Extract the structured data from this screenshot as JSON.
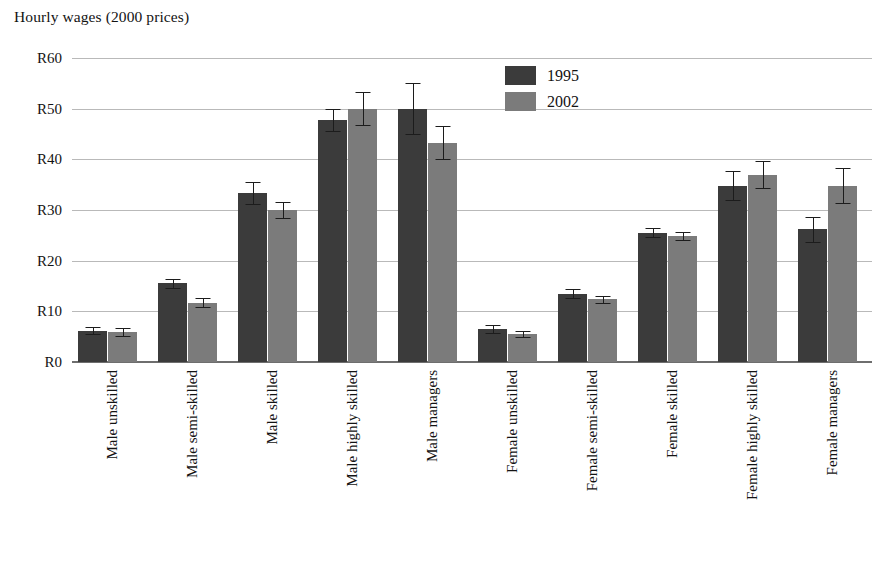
{
  "chart_data": {
    "type": "bar",
    "title": "Hourly wages (2000 prices)",
    "xlabel": "",
    "ylabel": "",
    "ylim": [
      0,
      60
    ],
    "ytick_labels": [
      "R60",
      "R50",
      "R40",
      "R30",
      "R20",
      "R10",
      "R0"
    ],
    "ytick_values": [
      60,
      50,
      40,
      30,
      20,
      10,
      0
    ],
    "grid": true,
    "legend_position": "top-center-right",
    "currency_prefix": "R",
    "categories": [
      "Male unskilled",
      "Male semi-skilled",
      "Male skilled",
      "Male highly skilled",
      "Male managers",
      "Female unskilled",
      "Female semi-skilled",
      "Female skilled",
      "Female highly skilled",
      "Female managers"
    ],
    "series": [
      {
        "name": "1995",
        "color": "#3b3b3b",
        "values": [
          6.2,
          15.5,
          33.4,
          47.7,
          50.0,
          6.5,
          13.5,
          25.5,
          34.8,
          26.2
        ],
        "errors": [
          0.7,
          0.8,
          2.2,
          2.2,
          5.0,
          0.8,
          0.9,
          0.9,
          2.8,
          2.5
        ]
      },
      {
        "name": "2002",
        "color": "#7b7b7b",
        "values": [
          6.0,
          11.7,
          30.0,
          50.0,
          43.3,
          5.5,
          12.4,
          24.8,
          37.0,
          34.8
        ],
        "errors": [
          0.8,
          0.9,
          1.6,
          3.3,
          3.3,
          0.6,
          0.7,
          0.8,
          2.6,
          3.4
        ]
      }
    ]
  },
  "legend": {
    "entries": [
      {
        "label": "1995",
        "color": "#3b3b3b"
      },
      {
        "label": "2002",
        "color": "#7b7b7b"
      }
    ]
  }
}
